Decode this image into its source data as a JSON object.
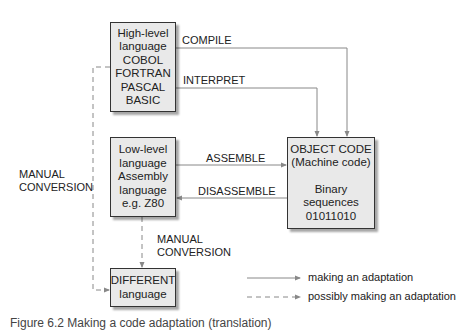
{
  "boxes": {
    "high_level": {
      "lines": [
        "High-level",
        "language",
        "COBOL",
        "FORTRAN",
        "PASCAL",
        "BASIC"
      ]
    },
    "low_level": {
      "lines": [
        "Low-level",
        "language",
        "Assembly",
        "language",
        "e.g. Z80"
      ]
    },
    "object_code": {
      "top_lines": [
        "OBJECT CODE",
        "(Machine code)"
      ],
      "bottom_lines": [
        "Binary",
        "sequences",
        "01011010"
      ]
    },
    "different": {
      "lines": [
        "DIFFERENT",
        "language"
      ]
    }
  },
  "edges": {
    "compile": "COMPILE",
    "interpret": "INTERPRET",
    "assemble": "ASSEMBLE",
    "disassemble": "DISASSEMBLE",
    "manual_conversion_left": [
      "MANUAL",
      "CONVERSION"
    ],
    "manual_conversion_middle": [
      "MANUAL",
      "CONVERSION"
    ]
  },
  "legend": {
    "solid": "making an adaptation",
    "dashed": "possibly making an adaptation"
  },
  "colors": {
    "box_fill": "#e9e9e9",
    "box_border": "#333333",
    "arrow": "#888888"
  },
  "caption": "Figure 6.2  Making a code adaptation (translation)"
}
